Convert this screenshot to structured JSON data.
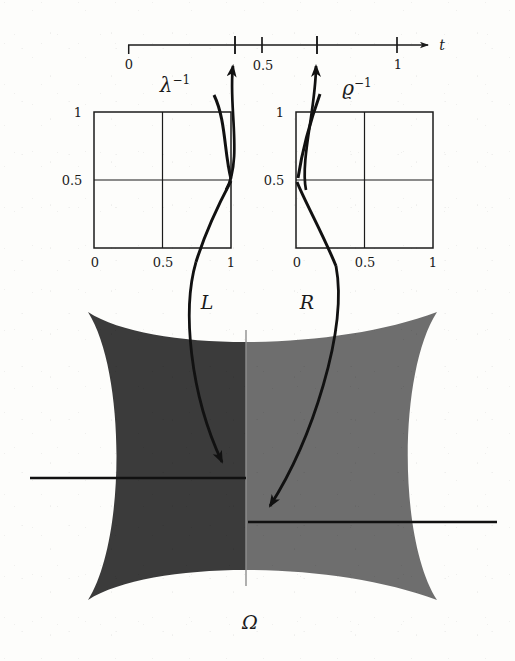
{
  "figure": {
    "background_color": "#fdfdfb",
    "ink_color": "#1b1b1b"
  },
  "t_axis": {
    "variable_label": "t",
    "tick_labels": [
      "0",
      "0.5",
      "1"
    ],
    "marked_tick_values": [
      0.4,
      0.7
    ],
    "range": [
      0,
      1
    ],
    "x_start_px": 128,
    "x_end_px": 397,
    "y_px": 45
  },
  "arrows_to_axis": [
    {
      "name": "lambda-inverse",
      "base_label": "λ",
      "exponent_label": "−1",
      "label_x": 175,
      "label_y": 85,
      "target_tick": 0.4
    },
    {
      "name": "varrho-inverse",
      "base_label": "ϱ",
      "exponent_label": "−1",
      "label_x": 357,
      "label_y": 88,
      "target_tick": 0.7
    }
  ],
  "plots": [
    {
      "name": "left-plot",
      "map_label": "L",
      "map_label_x": 207,
      "map_label_y": 302,
      "box_px": {
        "x": 94,
        "y": 112,
        "w": 137,
        "h": 136
      },
      "x_tick_labels": [
        "0",
        "0.5",
        "1"
      ],
      "y_tick_labels": [
        "0.5",
        "1"
      ],
      "gridlines": {
        "x": [
          0.5
        ],
        "y": [
          0.5
        ]
      },
      "branch_discontinuity_at": 1.0
    },
    {
      "name": "right-plot",
      "map_label": "R",
      "map_label_x": 307,
      "map_label_y": 302,
      "box_px": {
        "x": 296,
        "y": 112,
        "w": 137,
        "h": 136
      },
      "x_tick_labels": [
        "0",
        "0.5",
        "1"
      ],
      "y_tick_labels": [
        "0.5",
        "1"
      ],
      "gridlines": {
        "x": [
          0.5
        ],
        "y": [
          0.5
        ]
      },
      "branch_discontinuity_at": 0.0
    }
  ],
  "domain_region": {
    "name": "omega-region",
    "label": "Ω",
    "label_x": 250,
    "label_y": 622,
    "left_half_color": "#3b3b3b",
    "right_half_color": "#6e6e6e",
    "divider_color": "#8e8e8e",
    "bounds_px": {
      "x": 88,
      "y": 310,
      "w": 349,
      "h": 290
    }
  },
  "section_lines": [
    {
      "name": "left-section-line",
      "x1": 30,
      "y1": 478,
      "x2": 246,
      "y2": 478
    },
    {
      "name": "right-section-line",
      "x1": 248,
      "y1": 522,
      "x2": 497,
      "y2": 522
    }
  ],
  "mapping_arrows": [
    {
      "name": "L-mapping-arrow",
      "from_plot": "left-plot",
      "tip_x": 231,
      "tip_y": 478
    },
    {
      "name": "R-mapping-arrow",
      "from_plot": "right-plot",
      "tip_x": 259,
      "tip_y": 521
    }
  ]
}
